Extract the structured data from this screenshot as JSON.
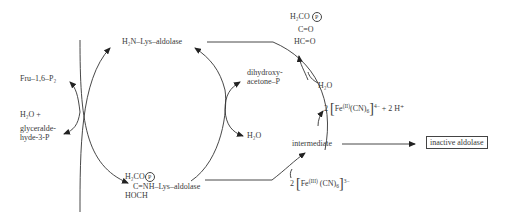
{
  "diagram": {
    "top_enzyme": "H₂N–Lys–aldolase",
    "substrate_in": "Fru–1,6–P₂",
    "product_left": {
      "line1": "H₂O +",
      "line2": "glyceralde-",
      "line3": "hyde-3-P"
    },
    "product_right": {
      "line1": "dihydroxy-",
      "line2": "acetone–P"
    },
    "water_right": "H₂O",
    "schiff_base": {
      "line1": "H₂CO",
      "phosphate": "P",
      "line2_prefix": "C",
      "line2_bond": "=",
      "line2_rest": "NH–Lys–aldolase",
      "line3": "HOCH"
    },
    "oxidized_product": {
      "line1": "H₂CO",
      "phosphate": "P",
      "line2": "C=O",
      "line3": "HC=O"
    },
    "water_top": "H₂O",
    "reduced_iron": {
      "coef": "2",
      "fe": "Fe",
      "ox": "(II)",
      "ligand": "(CN)",
      "n": "6",
      "charge": "4−",
      "extra": "+ 2 H⁺"
    },
    "oxidized_iron": {
      "coef": "2",
      "fe": "Fe",
      "ox": "(III)",
      "ligand": "(CN)",
      "n": "6",
      "charge": "3−"
    },
    "intermediate": "intermediate",
    "final_product": "inactive aldolase"
  }
}
